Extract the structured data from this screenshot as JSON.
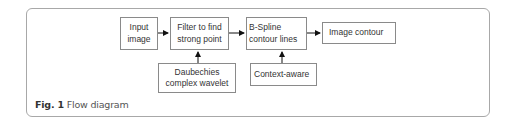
{
  "diagram": {
    "nodes": [
      {
        "id": "input",
        "label_line1": "Input",
        "label_line2": "image"
      },
      {
        "id": "filter",
        "label_line1": "Filter to find",
        "label_line2": "strong point"
      },
      {
        "id": "bspline",
        "label_line1": "B-Spline",
        "label_line2": "contour lines"
      },
      {
        "id": "contour",
        "label_line1": "Image contour",
        "label_line2": ""
      },
      {
        "id": "daubechies",
        "label_line1": "Daubechies",
        "label_line2": "complex wavelet"
      },
      {
        "id": "context",
        "label_line1": "Context-aware",
        "label_line2": ""
      }
    ],
    "edges": [
      {
        "from": "input",
        "to": "filter"
      },
      {
        "from": "filter",
        "to": "bspline"
      },
      {
        "from": "bspline",
        "to": "contour"
      },
      {
        "from": "daubechies",
        "to": "filter"
      },
      {
        "from": "context",
        "to": "bspline"
      }
    ],
    "colors": {
      "box_border": "#8a8a8a",
      "frame_border": "#a8a8a8",
      "arrow": "#111111",
      "text": "#333333"
    }
  },
  "caption": {
    "label": "Fig. 1",
    "text": "Flow diagram"
  }
}
